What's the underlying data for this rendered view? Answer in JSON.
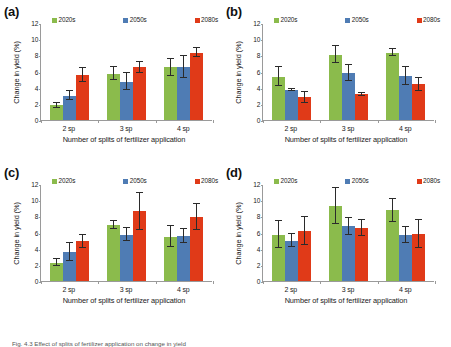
{
  "figure": {
    "caption_prefix": "Fig. 4.3",
    "caption_text": "Fig. 4.3  Effect of splits of fertilizer application on change in yield"
  },
  "legend": {
    "items": [
      {
        "label": "2020s",
        "color": "#8BBB4C"
      },
      {
        "label": "2050s",
        "color": "#4F7CB4"
      },
      {
        "label": "2080s",
        "color": "#E03A18"
      }
    ]
  },
  "axes": {
    "ylabel": "Change in yield (%)",
    "xlabel": "Number of splits of fertilizer application",
    "yticks": [
      "0",
      "2",
      "4",
      "6",
      "8",
      "10",
      "12"
    ],
    "ylim": [
      0,
      12
    ],
    "categories": [
      "2 sp",
      "3 sp",
      "4 sp"
    ]
  },
  "chart_data": [
    {
      "type": "bar",
      "panel": "(a)",
      "title": "",
      "xlabel": "Number of splits of fertilizer application",
      "ylabel": "Change in yield (%)",
      "ylim": [
        0,
        12
      ],
      "grid": false,
      "legend_position": "top",
      "categories": [
        "2 sp",
        "3 sp",
        "4 sp"
      ],
      "series": [
        {
          "name": "2020s",
          "color": "#8BBB4C",
          "values": [
            1.8,
            5.75,
            6.5
          ],
          "errors": [
            0.35,
            0.8,
            1.0
          ]
        },
        {
          "name": "2050s",
          "color": "#4F7CB4",
          "values": [
            3.0,
            4.75,
            6.6
          ],
          "errors": [
            0.55,
            1.05,
            1.35
          ]
        },
        {
          "name": "2080s",
          "color": "#E03A18",
          "values": [
            5.55,
            6.5,
            8.35
          ],
          "errors": [
            0.9,
            0.7,
            0.6
          ]
        }
      ]
    },
    {
      "type": "bar",
      "panel": "(b)",
      "title": "",
      "xlabel": "Number of splits of fertilizer application",
      "ylabel": "Change in yield (%)",
      "ylim": [
        0,
        12
      ],
      "grid": false,
      "legend_position": "top",
      "categories": [
        "2 sp",
        "3 sp",
        "4 sp"
      ],
      "series": [
        {
          "name": "2020s",
          "color": "#8BBB4C",
          "values": [
            5.35,
            8.1,
            8.35
          ],
          "errors": [
            1.2,
            1.0,
            0.4
          ]
        },
        {
          "name": "2050s",
          "color": "#4F7CB4",
          "values": [
            3.7,
            5.8,
            5.4
          ],
          "errors": [
            0.15,
            0.95,
            1.1
          ]
        },
        {
          "name": "2080s",
          "color": "#E03A18",
          "values": [
            2.8,
            3.2,
            4.4
          ],
          "errors": [
            0.65,
            0.2,
            0.8
          ]
        }
      ]
    },
    {
      "type": "bar",
      "panel": "(c)",
      "title": "",
      "xlabel": "Number of splits of fertilizer application",
      "ylabel": "Change in yield (%)",
      "ylim": [
        0,
        12
      ],
      "grid": false,
      "legend_position": "top",
      "categories": [
        "2 sp",
        "3 sp",
        "4 sp"
      ],
      "series": [
        {
          "name": "2020s",
          "color": "#8BBB4C",
          "values": [
            2.25,
            6.9,
            5.5
          ],
          "errors": [
            0.45,
            0.5,
            1.3
          ]
        },
        {
          "name": "2050s",
          "color": "#4F7CB4",
          "values": [
            3.55,
            5.75,
            5.6
          ],
          "errors": [
            1.1,
            0.8,
            0.85
          ]
        },
        {
          "name": "2080s",
          "color": "#E03A18",
          "values": [
            4.9,
            8.6,
            7.9
          ],
          "errors": [
            0.8,
            2.35,
            1.6
          ]
        }
      ]
    },
    {
      "type": "bar",
      "panel": "(d)",
      "title": "",
      "xlabel": "Number of splits of fertilizer application",
      "ylabel": "Change in yield (%)",
      "ylim": [
        0,
        12
      ],
      "grid": false,
      "legend_position": "top",
      "categories": [
        "2 sp",
        "3 sp",
        "4 sp"
      ],
      "series": [
        {
          "name": "2020s",
          "color": "#8BBB4C",
          "values": [
            5.75,
            9.3,
            8.75
          ],
          "errors": [
            1.65,
            2.2,
            1.45
          ]
        },
        {
          "name": "2050s",
          "color": "#4F7CB4",
          "values": [
            5.0,
            6.75,
            5.7
          ],
          "errors": [
            0.85,
            1.05,
            1.0
          ]
        },
        {
          "name": "2080s",
          "color": "#E03A18",
          "values": [
            6.2,
            6.55,
            5.8
          ],
          "errors": [
            1.7,
            0.95,
            1.75
          ]
        }
      ]
    }
  ]
}
